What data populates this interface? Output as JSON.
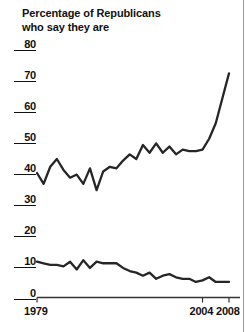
{
  "chart_data": {
    "type": "line",
    "title": "Percentage of Republicans who say they are",
    "title_lines": [
      "Percentage of Republicans",
      "who say they are"
    ],
    "xlabel": "",
    "ylabel": "",
    "xlim": [
      1979,
      2008
    ],
    "ylim": [
      0,
      80
    ],
    "grid": false,
    "legend": "none",
    "yticks": [
      0,
      10,
      20,
      30,
      40,
      50,
      60,
      70,
      80
    ],
    "ytick_labels": [
      "0",
      "10",
      "20",
      "30",
      "40",
      "50",
      "60",
      "70",
      "80"
    ],
    "xticks": [
      1979,
      2004,
      2008
    ],
    "xtick_labels": [
      "1979",
      "2004",
      "2008"
    ],
    "line_color": "#262626",
    "series": [
      {
        "name": "upper-line",
        "x": [
          1979,
          1980,
          1981,
          1982,
          1983,
          1984,
          1985,
          1986,
          1987,
          1988,
          1989,
          1990,
          1991,
          1992,
          1993,
          1994,
          1995,
          1996,
          1997,
          1998,
          1999,
          2000,
          2001,
          2002,
          2003,
          2004,
          2005,
          2006,
          2007,
          2008
        ],
        "values": [
          40,
          36.5,
          42,
          44.5,
          41,
          38.5,
          39.5,
          36.5,
          41.5,
          34.5,
          40.5,
          42,
          41.5,
          44,
          46,
          44.5,
          49,
          46.5,
          49.5,
          46.5,
          48.5,
          46,
          47.5,
          47,
          47,
          47.5,
          51,
          56,
          64,
          72
        ]
      },
      {
        "name": "lower-line",
        "x": [
          1979,
          1980,
          1981,
          1982,
          1983,
          1984,
          1985,
          1986,
          1987,
          1988,
          1989,
          1990,
          1991,
          1992,
          1993,
          1994,
          1995,
          1996,
          1997,
          1998,
          1999,
          2000,
          2001,
          2002,
          2003,
          2004,
          2005,
          2006,
          2007,
          2008
        ],
        "values": [
          11.5,
          11,
          10.5,
          10.5,
          10,
          11.5,
          9,
          12,
          9.5,
          11.5,
          11,
          11,
          11,
          9.5,
          8.5,
          8,
          7,
          8,
          6,
          7,
          7.5,
          6.5,
          6,
          6,
          5,
          5.5,
          6.5,
          5,
          5,
          5
        ]
      }
    ]
  }
}
